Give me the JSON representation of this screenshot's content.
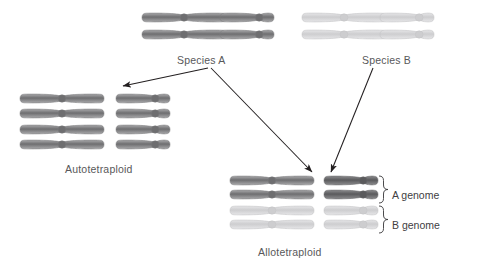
{
  "figure": {
    "background": "#ffffff"
  },
  "palette": {
    "species_a_dark": "#6e6e70",
    "species_a_mid": "#8a8a8c",
    "species_a_light": "#a9a9ab",
    "species_b_pale": "#cdcdcf",
    "species_b_mid": "#bdbdbf",
    "outline": "#9a9a9c",
    "arrow": "#231f20",
    "text": "#58585a"
  },
  "labels": {
    "species_a": "Species A",
    "species_b": "Species B",
    "autotetraploid": "Autotetraploid",
    "allotetraploid": "Allotetraploid",
    "a_genome": "A genome",
    "b_genome": "B genome"
  },
  "groups": {
    "species_a": {
      "name": "Species A",
      "rows": 2,
      "cols": 2,
      "chromosomes": [
        {
          "type": "long",
          "shade": "dark",
          "x": 140,
          "y": 19
        },
        {
          "type": "short",
          "shade": "dark",
          "x": 218,
          "y": 19
        },
        {
          "type": "long",
          "shade": "dark",
          "x": 140,
          "y": 36
        },
        {
          "type": "short",
          "shade": "dark",
          "x": 218,
          "y": 36
        }
      ]
    },
    "species_b": {
      "name": "Species B",
      "rows": 2,
      "cols": 2,
      "chromosomes": [
        {
          "type": "long",
          "shade": "pale",
          "x": 300,
          "y": 19
        },
        {
          "type": "short",
          "shade": "pale",
          "x": 378,
          "y": 19
        },
        {
          "type": "long",
          "shade": "pale",
          "x": 300,
          "y": 36
        },
        {
          "type": "short",
          "shade": "pale",
          "x": 378,
          "y": 36
        }
      ]
    },
    "autotetraploid": {
      "name": "Autotetraploid",
      "rows": 4,
      "cols": 2,
      "chromosomes": [
        {
          "type": "long",
          "shade": "dark",
          "x": 18,
          "y": 100
        },
        {
          "type": "short",
          "shade": "dark",
          "x": 114,
          "y": 100
        },
        {
          "type": "long",
          "shade": "dark",
          "x": 18,
          "y": 115
        },
        {
          "type": "short",
          "shade": "dark",
          "x": 114,
          "y": 115
        },
        {
          "type": "long",
          "shade": "dark",
          "x": 18,
          "y": 131
        },
        {
          "type": "short",
          "shade": "dark",
          "x": 114,
          "y": 131
        },
        {
          "type": "long",
          "shade": "dark",
          "x": 18,
          "y": 146
        },
        {
          "type": "short",
          "shade": "dark",
          "x": 114,
          "y": 146
        }
      ]
    },
    "allotetraploid": {
      "name": "Allotetraploid",
      "rows": 4,
      "cols": 2,
      "chromosomes": [
        {
          "type": "long",
          "shade": "dark",
          "x": 228,
          "y": 182
        },
        {
          "type": "short",
          "shade": "darker",
          "x": 322,
          "y": 182
        },
        {
          "type": "long",
          "shade": "dark",
          "x": 228,
          "y": 196
        },
        {
          "type": "short",
          "shade": "darker",
          "x": 322,
          "y": 196
        },
        {
          "type": "long",
          "shade": "pale",
          "x": 228,
          "y": 212
        },
        {
          "type": "short",
          "shade": "pale",
          "x": 322,
          "y": 212
        },
        {
          "type": "long",
          "shade": "pale",
          "x": 228,
          "y": 226
        },
        {
          "type": "short",
          "shade": "pale",
          "x": 322,
          "y": 226
        }
      ]
    }
  },
  "arrows": [
    {
      "name": "species-a-to-autotetraploid",
      "x1": 208,
      "y1": 68,
      "x2": 123,
      "y2": 86
    },
    {
      "name": "species-a-to-allotetraploid",
      "x1": 211,
      "y1": 68,
      "x2": 312,
      "y2": 172
    },
    {
      "name": "species-b-to-allotetraploid",
      "x1": 373,
      "y1": 68,
      "x2": 331,
      "y2": 172
    }
  ],
  "braces": [
    {
      "name": "a-genome-brace",
      "label": "A genome",
      "top": 176,
      "bottom": 203,
      "x": 379,
      "label_x": 392,
      "label_y": 189
    },
    {
      "name": "b-genome-brace",
      "label": "B genome",
      "top": 206,
      "bottom": 233,
      "x": 379,
      "label_x": 392,
      "label_y": 219
    }
  ],
  "text_positions": {
    "species_a": {
      "x": 177,
      "y": 54
    },
    "species_b": {
      "x": 362,
      "y": 54
    },
    "autotetraploid": {
      "x": 65,
      "y": 163
    },
    "allotetraploid": {
      "x": 258,
      "y": 246
    }
  }
}
